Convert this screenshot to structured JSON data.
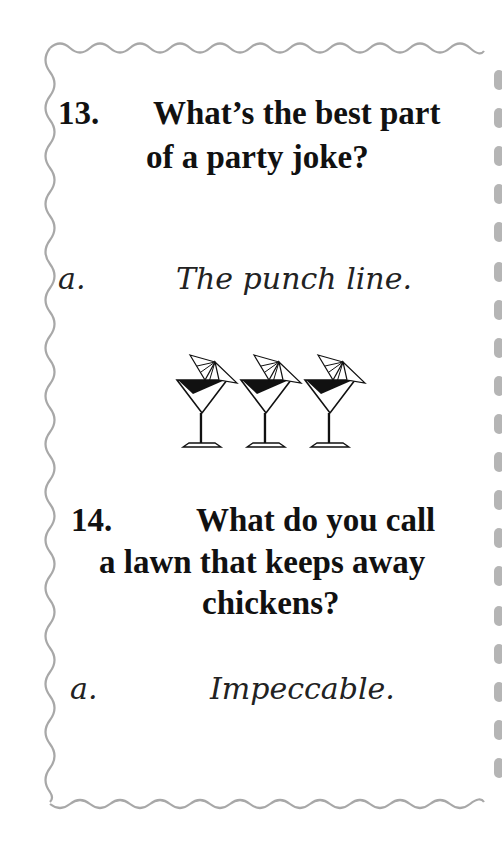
{
  "card": {
    "border_color": "#a8a8a8",
    "questions": [
      {
        "number": "13.",
        "line1": "What’s the best part",
        "line2": "of a party joke?",
        "answer_label": "a.",
        "answer": "The punch line."
      },
      {
        "number": "14.",
        "line1": "What do you call",
        "line2": "a lawn that keeps away",
        "line3": "chickens?",
        "answer_label": "a.",
        "answer": "Impeccable."
      }
    ],
    "divider": {
      "icon": "martini-glasses-icon",
      "count": 3
    }
  }
}
